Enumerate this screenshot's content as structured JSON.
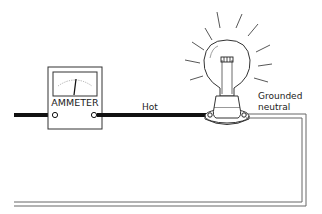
{
  "diagram": {
    "type": "electrical-circuit",
    "components": [
      {
        "id": "ammeter",
        "label": "AMMETER"
      },
      {
        "id": "bulb",
        "label": ""
      },
      {
        "id": "socket",
        "label": ""
      }
    ],
    "wires": [
      {
        "id": "hot",
        "label": "Hot",
        "style": "thick-black"
      },
      {
        "id": "neutral",
        "label_line1": "Grounded",
        "label_line2": "neutral",
        "style": "double-line"
      }
    ]
  },
  "colors": {
    "background": "#ffffff",
    "ink": "#222222",
    "hot_wire": "#111111",
    "neutral_wire": "#666666"
  }
}
